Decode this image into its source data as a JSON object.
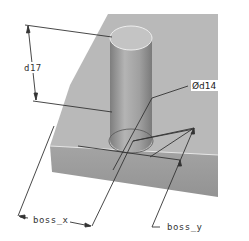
{
  "figure": {
    "type": "cad-dimensioned-part",
    "dimensions": {
      "height": {
        "label": "d17"
      },
      "diameter": {
        "symbol": "Ø",
        "label": "d14",
        "display": "Ød14"
      },
      "x_offset": {
        "label": "boss_x"
      },
      "y_offset": {
        "label": "boss_y"
      }
    },
    "colors": {
      "plate_top": "#b9b9b9",
      "plate_front": "#9c9c9c",
      "cylinder": "#a8a8a8",
      "cylinder_top": "#c4c4c4",
      "dim_line": "#333333",
      "background": "#ffffff"
    }
  }
}
